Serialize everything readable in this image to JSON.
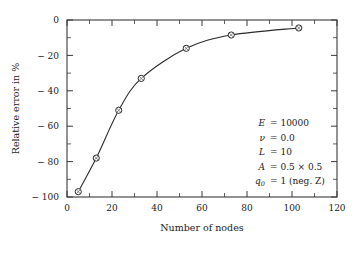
{
  "chart_data": {
    "type": "line",
    "title": "",
    "subtitle": "",
    "xlabel": "Number of nodes",
    "ylabel": "Relative error in %",
    "xlim": [
      0,
      120
    ],
    "ylim": [
      -100,
      0
    ],
    "grid": false,
    "legend_position": "none",
    "x_major_ticks": [
      0,
      20,
      40,
      60,
      80,
      100,
      120
    ],
    "x_major_tick_labels": [
      "0",
      "20",
      "40",
      "60",
      "80",
      "100",
      "120"
    ],
    "x_minor_ticks": [
      10,
      30,
      50,
      70,
      90,
      110
    ],
    "y_major_ticks": [
      0,
      -20,
      -40,
      -60,
      -80,
      -100
    ],
    "y_major_tick_labels": [
      "0",
      "− 20",
      "− 40",
      "− 60",
      "− 80",
      "− 100"
    ],
    "y_minor_ticks": [
      -10,
      -30,
      -50,
      -70,
      -90
    ],
    "series": [
      {
        "name": "relative error",
        "marker": "circle-with-cross",
        "x": [
          5,
          13,
          23,
          33,
          53,
          73,
          103
        ],
        "values": [
          -97,
          -78,
          -51,
          -33,
          -16,
          -8.5,
          -4.5
        ]
      }
    ],
    "annotations": [
      {
        "symbol": "E",
        "relation": "=",
        "value": "10000"
      },
      {
        "symbol": "ν",
        "relation": "=",
        "value": "0.0"
      },
      {
        "symbol": "L",
        "relation": "=",
        "value": "10"
      },
      {
        "symbol": "A",
        "relation": "=",
        "value": "0.5 × 0.5"
      },
      {
        "symbol": "q",
        "subscript": "0",
        "relation": "=",
        "value": "1 (neg. Z)"
      }
    ]
  },
  "colors": {
    "axis": "#3a3a3a",
    "curve": "#2b2b2b",
    "marker_face": "#ffffff",
    "marker_edge": "#2b2b2b",
    "text": "#1a1a1a",
    "background": "#ffffff"
  }
}
